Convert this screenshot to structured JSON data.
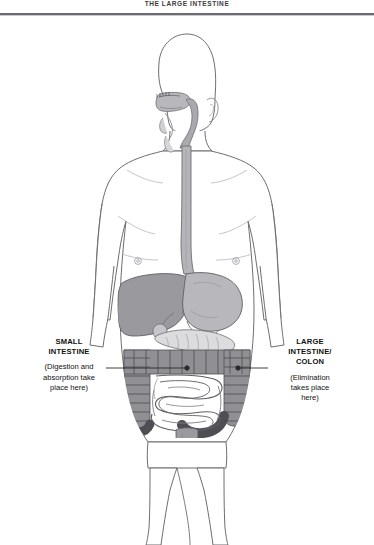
{
  "document": {
    "title": "THE LARGE INTESTINE"
  },
  "diagram": {
    "name": "human-digestive-system",
    "alt": "Front view outline of a human body showing the digestive tract: mouth, pharynx, esophagus, stomach, liver, pancreas, small intestine, large intestine/colon and rectum."
  },
  "callouts": {
    "small_intestine": {
      "heading_line1": "SMALL",
      "heading_line2": "INTESTINE",
      "note_line1": "(Digestion and",
      "note_line2": "absorption take",
      "note_line3": "place here)"
    },
    "large_intestine": {
      "heading_line1": "LARGE",
      "heading_line2": "INTESTINE/",
      "heading_line3": "COLON",
      "note_line1": "(Elimination",
      "note_line2": "takes place",
      "note_line3": "here)"
    }
  },
  "colors": {
    "page_background": "#ffffff",
    "outline": "#6d6d73",
    "rule": "#6b6b70",
    "liver": "#9a9a9e",
    "stomach": "#b8b8bc",
    "pancreas": "#d8d8da",
    "colon": "#8f8f94",
    "small_intestine": "#fdfdfd",
    "esophagus": "#b5b5b9",
    "rectum": "#9b9b9f",
    "text": "#111111"
  },
  "organs": [
    {
      "id": "oral-cavity",
      "label": "Mouth / oral cavity"
    },
    {
      "id": "pharynx",
      "label": "Pharynx"
    },
    {
      "id": "esophagus",
      "label": "Esophagus"
    },
    {
      "id": "liver",
      "label": "Liver"
    },
    {
      "id": "stomach",
      "label": "Stomach"
    },
    {
      "id": "pancreas",
      "label": "Pancreas"
    },
    {
      "id": "large-intestine",
      "label": "Large intestine / colon"
    },
    {
      "id": "small-intestine",
      "label": "Small intestine"
    },
    {
      "id": "rectum",
      "label": "Rectum"
    }
  ]
}
